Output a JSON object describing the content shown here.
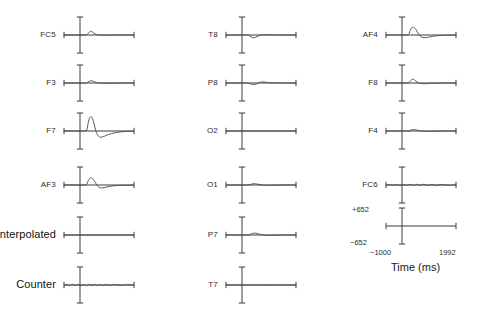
{
  "figure": {
    "type": "erp-channel-grid",
    "background": "#ffffff",
    "trace_color": "#4a4a4a",
    "axis_color": "#3a3a3a"
  },
  "axis": {
    "time_label": "Time (ms)",
    "y_top_label": "+652",
    "y_bottom_label": "−652",
    "x_left_label": "−1000",
    "x_right_label": "1992"
  },
  "chart_data": {
    "type": "line",
    "title": "",
    "xlabel": "Time (ms)",
    "ylabel": "",
    "xlim": [
      -1000,
      1992
    ],
    "ylim": [
      -652,
      652
    ],
    "grid": false,
    "legend": "none",
    "x_ticks": [
      -1000,
      1992
    ],
    "y_ticks": [
      -652,
      652
    ],
    "columns": 3,
    "series": [
      {
        "name": "FC5",
        "column": 0,
        "row": 0,
        "description": "small positive bump just after zero",
        "x": [
          -1000,
          -700,
          -400,
          -150,
          -40,
          60,
          140,
          230,
          330,
          460,
          620,
          900,
          1300,
          1992
        ],
        "values": [
          0,
          2,
          -4,
          2,
          8,
          95,
          150,
          120,
          45,
          8,
          -6,
          -4,
          0,
          2
        ]
      },
      {
        "name": "F3",
        "column": 0,
        "row": 1,
        "description": "very small positive bump after zero",
        "x": [
          -1000,
          -700,
          -400,
          -150,
          -40,
          60,
          160,
          260,
          380,
          520,
          700,
          1000,
          1400,
          1992
        ],
        "values": [
          0,
          -3,
          3,
          -2,
          4,
          60,
          95,
          70,
          25,
          0,
          -8,
          -6,
          -2,
          0
        ]
      },
      {
        "name": "F7",
        "column": 0,
        "row": 2,
        "description": "large positive peak then deep negative trough",
        "x": [
          -1000,
          -600,
          -300,
          -120,
          -30,
          50,
          120,
          200,
          280,
          360,
          450,
          560,
          700,
          900,
          1200,
          1600,
          1992
        ],
        "values": [
          0,
          4,
          -6,
          8,
          40,
          420,
          590,
          560,
          330,
          10,
          -190,
          -260,
          -230,
          -150,
          -70,
          -20,
          -6
        ]
      },
      {
        "name": "AF3",
        "column": 0,
        "row": 3,
        "description": "moderate positive peak then small negative dip",
        "x": [
          -1000,
          -600,
          -300,
          -120,
          -30,
          60,
          150,
          240,
          330,
          430,
          560,
          720,
          950,
          1300,
          1992
        ],
        "values": [
          0,
          3,
          -5,
          6,
          30,
          230,
          310,
          250,
          120,
          -40,
          -120,
          -110,
          -60,
          -20,
          -4
        ]
      },
      {
        "name": "Interpolated",
        "column": 0,
        "row": 4,
        "description": "flat zero line",
        "x": [
          -1000,
          -500,
          0,
          500,
          1000,
          1500,
          1992
        ],
        "values": [
          0,
          0,
          0,
          0,
          0,
          0,
          0
        ]
      },
      {
        "name": "Counter",
        "column": 0,
        "row": 5,
        "description": "low amplitude noisy sawtooth around zero",
        "x": [
          -1000,
          -880,
          -760,
          -640,
          -520,
          -400,
          -280,
          -160,
          -40,
          80,
          200,
          320,
          440,
          560,
          680,
          800,
          960,
          1150,
          1400,
          1700,
          1992
        ],
        "values": [
          -30,
          25,
          -28,
          30,
          -25,
          26,
          -30,
          22,
          -26,
          28,
          -24,
          30,
          -28,
          22,
          -26,
          24,
          -20,
          22,
          -18,
          16,
          -12
        ]
      },
      {
        "name": "T8",
        "column": 1,
        "row": 0,
        "description": "small negative dip after zero",
        "x": [
          -1000,
          -700,
          -400,
          -150,
          -30,
          70,
          170,
          270,
          390,
          520,
          700,
          950,
          1350,
          1992
        ],
        "values": [
          0,
          -4,
          4,
          -3,
          -10,
          -80,
          -120,
          -95,
          -40,
          5,
          12,
          6,
          0,
          -2
        ]
      },
      {
        "name": "P8",
        "column": 1,
        "row": 1,
        "description": "tiny negative dip then small positive ripple",
        "x": [
          -1000,
          -700,
          -400,
          -150,
          -30,
          80,
          180,
          300,
          420,
          560,
          720,
          950,
          1350,
          1992
        ],
        "values": [
          0,
          3,
          -4,
          2,
          -6,
          -50,
          -70,
          -40,
          20,
          45,
          30,
          10,
          2,
          0
        ]
      },
      {
        "name": "O2",
        "column": 1,
        "row": 2,
        "description": "flat zero line",
        "x": [
          -1000,
          -500,
          0,
          500,
          1000,
          1500,
          1992
        ],
        "values": [
          0,
          0,
          0,
          0,
          0,
          0,
          0
        ]
      },
      {
        "name": "O1",
        "column": 1,
        "row": 3,
        "description": "small ripple slightly after zero",
        "x": [
          -1000,
          -700,
          -400,
          -150,
          -20,
          90,
          200,
          320,
          450,
          600,
          800,
          1100,
          1500,
          1992
        ],
        "values": [
          0,
          -2,
          3,
          -2,
          6,
          35,
          55,
          40,
          18,
          -5,
          -12,
          -6,
          0,
          1
        ]
      },
      {
        "name": "P7",
        "column": 1,
        "row": 4,
        "description": "small positive ripple after zero",
        "x": [
          -1000,
          -700,
          -400,
          -150,
          -20,
          90,
          200,
          330,
          470,
          620,
          820,
          1100,
          1500,
          1992
        ],
        "values": [
          0,
          4,
          -4,
          3,
          8,
          55,
          80,
          60,
          25,
          0,
          -14,
          -8,
          -2,
          0
        ]
      },
      {
        "name": "T7",
        "column": 1,
        "row": 5,
        "description": "flat zero line",
        "x": [
          -1000,
          -500,
          0,
          500,
          1000,
          1500,
          1992
        ],
        "values": [
          0,
          0,
          0,
          0,
          0,
          0,
          0
        ]
      },
      {
        "name": "AF4",
        "column": 2,
        "row": 0,
        "description": "moderate positive peak then small negative dip",
        "x": [
          -1000,
          -600,
          -300,
          -120,
          -30,
          60,
          150,
          250,
          340,
          450,
          580,
          760,
          1000,
          1400,
          1992
        ],
        "values": [
          0,
          3,
          -5,
          5,
          35,
          250,
          330,
          270,
          130,
          -30,
          -110,
          -100,
          -55,
          -15,
          -3
        ]
      },
      {
        "name": "F8",
        "column": 2,
        "row": 1,
        "description": "small sharp positive bump after zero",
        "x": [
          -1000,
          -700,
          -400,
          -150,
          -30,
          60,
          140,
          230,
          330,
          470,
          650,
          900,
          1350,
          1992
        ],
        "values": [
          0,
          -3,
          4,
          -3,
          10,
          110,
          165,
          120,
          40,
          -20,
          -30,
          -16,
          -3,
          0
        ]
      },
      {
        "name": "F4",
        "column": 2,
        "row": 2,
        "description": "very small bump near zero",
        "x": [
          -1000,
          -700,
          -400,
          -150,
          -30,
          70,
          170,
          290,
          430,
          600,
          820,
          1150,
          1550,
          1992
        ],
        "values": [
          0,
          2,
          -3,
          2,
          5,
          40,
          60,
          45,
          15,
          -8,
          -10,
          -5,
          0,
          1
        ]
      },
      {
        "name": "FC6",
        "column": 2,
        "row": 3,
        "description": "low amplitude noisy trace around zero",
        "x": [
          -1000,
          -850,
          -700,
          -550,
          -400,
          -250,
          -100,
          40,
          180,
          320,
          460,
          600,
          760,
          940,
          1150,
          1400,
          1700,
          1992
        ],
        "values": [
          -10,
          14,
          -12,
          16,
          -10,
          18,
          -14,
          30,
          -20,
          34,
          -18,
          26,
          -16,
          20,
          -14,
          16,
          -10,
          8
        ]
      }
    ]
  },
  "channels": [
    {
      "label": "FC5",
      "label_size": "small",
      "x": 60,
      "y": 14,
      "series": 0
    },
    {
      "label": "F3",
      "label_size": "small",
      "x": 60,
      "y": 62,
      "series": 1
    },
    {
      "label": "F7",
      "label_size": "small",
      "x": 60,
      "y": 110,
      "series": 2
    },
    {
      "label": "AF3",
      "label_size": "small",
      "x": 60,
      "y": 164,
      "series": 3
    },
    {
      "label": "Interpolated",
      "label_size": "big",
      "x": 60,
      "y": 214,
      "series": 4
    },
    {
      "label": "Counter",
      "label_size": "big",
      "x": 60,
      "y": 264,
      "series": 5
    },
    {
      "label": "T8",
      "label_size": "small",
      "x": 222,
      "y": 14,
      "series": 6
    },
    {
      "label": "P8",
      "label_size": "small",
      "x": 222,
      "y": 62,
      "series": 7
    },
    {
      "label": "O2",
      "label_size": "small",
      "x": 222,
      "y": 110,
      "series": 8
    },
    {
      "label": "O1",
      "label_size": "small",
      "x": 222,
      "y": 164,
      "series": 9
    },
    {
      "label": "P7",
      "label_size": "small",
      "x": 222,
      "y": 214,
      "series": 10
    },
    {
      "label": "T7",
      "label_size": "small",
      "x": 222,
      "y": 264,
      "series": 11
    },
    {
      "label": "AF4",
      "label_size": "small",
      "x": 382,
      "y": 14,
      "series": 12
    },
    {
      "label": "F8",
      "label_size": "small",
      "x": 382,
      "y": 62,
      "series": 13
    },
    {
      "label": "F4",
      "label_size": "small",
      "x": 382,
      "y": 110,
      "series": 14
    },
    {
      "label": "FC6",
      "label_size": "small",
      "x": 382,
      "y": 164,
      "series": 15
    }
  ]
}
